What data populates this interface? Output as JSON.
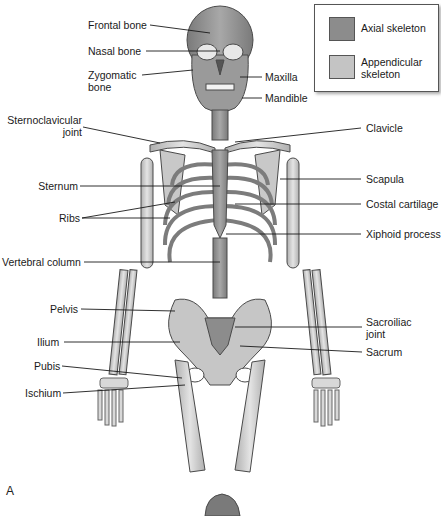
{
  "figure": {
    "panel_label": "A",
    "legend": {
      "items": [
        {
          "label": "Axial skeleton",
          "color": "#8c8c8c"
        },
        {
          "label": "Appendicular skeleton",
          "label_lines": [
            "Appendicular",
            "skeleton"
          ],
          "color": "#c4c4c4"
        }
      ]
    },
    "labels_left": [
      {
        "text": "Frontal bone"
      },
      {
        "text": "Nasal bone"
      },
      {
        "text": "Zygomatic",
        "text2": "bone"
      },
      {
        "text": "Sternoclavicular",
        "text2": "joint"
      },
      {
        "text": "Sternum"
      },
      {
        "text": "Ribs"
      },
      {
        "text": "Vertebral column"
      },
      {
        "text": "Pelvis"
      },
      {
        "text": "Ilium"
      },
      {
        "text": "Pubis"
      },
      {
        "text": "Ischium"
      }
    ],
    "labels_right": [
      {
        "text": "Maxilla"
      },
      {
        "text": "Mandible"
      },
      {
        "text": "Clavicle"
      },
      {
        "text": "Scapula"
      },
      {
        "text": "Costal cartilage"
      },
      {
        "text": "Xiphoid process"
      },
      {
        "text": "Sacroiliac",
        "text2": "joint"
      },
      {
        "text": "Sacrum"
      }
    ],
    "colors": {
      "axial": "#8c8c8c",
      "appendicular": "#c4c4c4",
      "bone_outline": "#4a4a4a",
      "leader_line": "#1a1a1a"
    }
  }
}
